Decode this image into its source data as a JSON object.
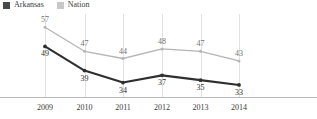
{
  "chart_data": {
    "type": "line",
    "title": "",
    "xlabel": "",
    "ylabel": "",
    "categories": [
      "2009",
      "2010",
      "2011",
      "2012",
      "2013",
      "2014"
    ],
    "series": [
      {
        "name": "Arkansas",
        "color": "#2f2f2f",
        "values": [
          49,
          39,
          34,
          37,
          35,
          33
        ],
        "label_position": "below"
      },
      {
        "name": "Nation",
        "color": "#b5b5b5",
        "values": [
          57,
          47,
          44,
          48,
          47,
          43
        ],
        "label_position": "above"
      }
    ],
    "ylim": [
      28,
      60
    ],
    "grid": "vertical",
    "legend_position": "top-left"
  },
  "legend": {
    "entries": [
      {
        "label": "Arkansas",
        "color": "#4a4a4a"
      },
      {
        "label": "Nation",
        "color": "#c8c8c8"
      }
    ]
  },
  "colors": {
    "arkansas_line": "#2f2f2f",
    "nation_line": "#c0c0c0",
    "gridline": "#e2e2e2",
    "axis": "#b9b9b9",
    "text": "#3a3a3a"
  }
}
